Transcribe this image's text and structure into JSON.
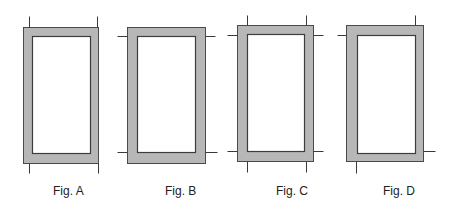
{
  "figures": [
    {
      "id": "A",
      "label": "Fig. A",
      "label_x": 53,
      "outer": {
        "x": 23,
        "y": 27,
        "w": 75,
        "h": 136
      },
      "inner": {
        "x": 32,
        "y": 36,
        "w": 58,
        "h": 117
      },
      "ticks": [
        {
          "x1": 29,
          "y1": 16,
          "x2": 29,
          "y2": 27
        },
        {
          "x1": 97,
          "y1": 16,
          "x2": 97,
          "y2": 27
        },
        {
          "x1": 29,
          "y1": 163,
          "x2": 29,
          "y2": 173
        },
        {
          "x1": 98,
          "y1": 163,
          "x2": 98,
          "y2": 173
        }
      ]
    },
    {
      "id": "B",
      "label": "Fig. B",
      "label_x": 165,
      "outer": {
        "x": 127,
        "y": 27,
        "w": 78,
        "h": 136
      },
      "inner": {
        "x": 137,
        "y": 36,
        "w": 58,
        "h": 116
      },
      "ticks": [
        {
          "x1": 117,
          "y1": 36,
          "x2": 127,
          "y2": 36
        },
        {
          "x1": 205,
          "y1": 36,
          "x2": 215,
          "y2": 36
        },
        {
          "x1": 117,
          "y1": 152,
          "x2": 127,
          "y2": 152
        },
        {
          "x1": 205,
          "y1": 152,
          "x2": 217,
          "y2": 152
        }
      ]
    },
    {
      "id": "C",
      "label": "Fig. C",
      "label_x": 276,
      "outer": {
        "x": 237,
        "y": 25,
        "w": 76,
        "h": 136
      },
      "inner": {
        "x": 247,
        "y": 34,
        "w": 57,
        "h": 117
      },
      "ticks": [
        {
          "x1": 247,
          "y1": 15,
          "x2": 247,
          "y2": 25
        },
        {
          "x1": 306,
          "y1": 15,
          "x2": 306,
          "y2": 25
        },
        {
          "x1": 247,
          "y1": 161,
          "x2": 247,
          "y2": 172
        },
        {
          "x1": 306,
          "y1": 161,
          "x2": 306,
          "y2": 172
        },
        {
          "x1": 227,
          "y1": 35,
          "x2": 237,
          "y2": 35
        },
        {
          "x1": 313,
          "y1": 35,
          "x2": 323,
          "y2": 35
        },
        {
          "x1": 227,
          "y1": 151,
          "x2": 237,
          "y2": 151
        },
        {
          "x1": 313,
          "y1": 151,
          "x2": 323,
          "y2": 151
        }
      ]
    },
    {
      "id": "D",
      "label": "Fig. D",
      "label_x": 383,
      "outer": {
        "x": 346,
        "y": 25,
        "w": 77,
        "h": 136
      },
      "inner": {
        "x": 357,
        "y": 35,
        "w": 58,
        "h": 118
      },
      "ticks": [
        {
          "x1": 415,
          "y1": 15,
          "x2": 415,
          "y2": 25
        },
        {
          "x1": 337,
          "y1": 35,
          "x2": 346,
          "y2": 35
        },
        {
          "x1": 356,
          "y1": 161,
          "x2": 356,
          "y2": 173
        },
        {
          "x1": 423,
          "y1": 151,
          "x2": 435,
          "y2": 151
        }
      ]
    }
  ],
  "colors": {
    "frame_fill": "#b7b7b7",
    "frame_stroke": "#4a4a4a",
    "inner_fill": "#ffffff",
    "tick_stroke": "#3a3a3a",
    "label_color": "#222222"
  }
}
